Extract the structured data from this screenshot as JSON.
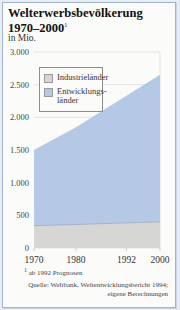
{
  "title": {
    "line1": "Welterwerbsbevölkerung",
    "line2": "1970–2000",
    "footnote_marker": "1"
  },
  "unit": "in Mio.",
  "legend": {
    "industrial": "Industrieländer",
    "developing_line1": "Entwicklungs-",
    "developing_line2": "länder"
  },
  "footnote": {
    "marker": "1",
    "text": "ab 1992 Prognosen"
  },
  "source": {
    "line1": "Quelle: Weltbank, Weltentwicklungsbericht 1994;",
    "line2": "eigene Berechnungen"
  },
  "axis": {
    "y_ticks": [
      "3.000",
      "2.500",
      "2.000",
      "1.500",
      "1.000",
      "500",
      "0"
    ],
    "x_ticks": [
      "1970",
      "1980",
      "1992",
      "2000"
    ]
  },
  "colors": {
    "industrial": "#d6d6d4",
    "developing": "#b5c9e6",
    "frame_border": "#9fb3cf"
  },
  "chart_data": {
    "type": "area",
    "title": "Welterwerbsbevölkerung 1970–2000",
    "subtitle": "in Mio.",
    "xlabel": "",
    "ylabel": "in Mio.",
    "x": [
      1970,
      1980,
      1992,
      2000
    ],
    "series": [
      {
        "name": "Industrieländer",
        "values": [
          340,
          360,
          385,
          400
        ]
      },
      {
        "name": "Entwicklungsländer",
        "values": [
          1160,
          1490,
          1945,
          2250
        ]
      }
    ],
    "stacked_totals": [
      1500,
      1850,
      2330,
      2650
    ],
    "ylim": [
      0,
      3000
    ],
    "yticks": [
      0,
      500,
      1000,
      1500,
      2000,
      2500,
      3000
    ],
    "grid": true,
    "legend_position": "upper left inside plot",
    "annotations": [
      "1 ab 1992 Prognosen",
      "Quelle: Weltbank, Weltentwicklungsbericht 1994; eigene Berechnungen"
    ]
  }
}
